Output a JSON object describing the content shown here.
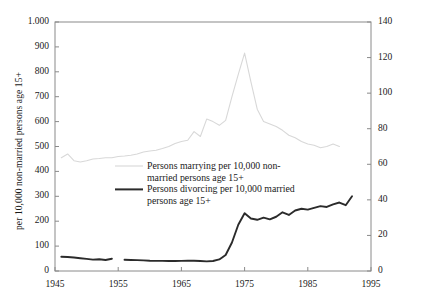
{
  "chart_data": {
    "type": "line",
    "title": "",
    "subtitle": "",
    "xlabel": "",
    "ylabel": "per 10,000 non-married persons age 15+",
    "y2label": "per 10,000 married persons",
    "xlim": [
      1945,
      1995
    ],
    "ylim": [
      0,
      1000
    ],
    "y2lim": [
      0,
      140
    ],
    "grid": false,
    "legend_position": "inside-center-left",
    "xticks": [
      "1945",
      "1955",
      "1965",
      "1975",
      "1985",
      "1995"
    ],
    "xtick_values": [
      1945,
      1955,
      1965,
      1975,
      1985,
      1995
    ],
    "yticks": [
      "0",
      "100",
      "200",
      "300",
      "400",
      "500",
      "600",
      "700",
      "800",
      "900",
      "1.000"
    ],
    "ytick_values": [
      0,
      100,
      200,
      300,
      400,
      500,
      600,
      700,
      800,
      900,
      1000
    ],
    "y2ticks": [
      "0",
      "20",
      "40",
      "60",
      "80",
      "100",
      "120",
      "140"
    ],
    "y2tick_values": [
      0,
      20,
      40,
      60,
      80,
      100,
      120,
      140
    ],
    "series": [
      {
        "name": "Persons marrying per 10,000 non-married persons age 15+",
        "axis": "left",
        "color": "#d8d8d8",
        "width": 1.1,
        "x": [
          1946,
          1947,
          1948,
          1949,
          1950,
          1951,
          1952,
          1953,
          1954,
          1955,
          1956,
          1957,
          1958,
          1959,
          1960,
          1961,
          1962,
          1963,
          1964,
          1965,
          1966,
          1967,
          1968,
          1969,
          1970,
          1971,
          1972,
          1973,
          1974,
          1975,
          1976,
          1977,
          1978,
          1979,
          1980,
          1981,
          1982,
          1983,
          1984,
          1985,
          1986,
          1987,
          1988,
          1989,
          1990
        ],
        "values": [
          455,
          470,
          443,
          438,
          443,
          450,
          452,
          455,
          455,
          460,
          462,
          465,
          470,
          478,
          482,
          485,
          492,
          500,
          512,
          520,
          525,
          560,
          540,
          610,
          600,
          585,
          605,
          700,
          790,
          875,
          760,
          650,
          600,
          590,
          580,
          565,
          545,
          535,
          520,
          510,
          505,
          495,
          500,
          510,
          500
        ]
      },
      {
        "name": "Persons divorcing per 10,000 married persons age 15+",
        "axis": "right",
        "color": "#2b2b2b",
        "width": 1.9,
        "segments": [
          {
            "x": [
              1946,
              1947,
              1948,
              1949,
              1950,
              1951,
              1952,
              1953,
              1954
            ],
            "values": [
              8.0,
              7.9,
              7.6,
              7.2,
              6.8,
              6.4,
              6.6,
              6.2,
              6.9
            ]
          },
          {
            "x": [
              1956,
              1957,
              1958,
              1959,
              1960,
              1961,
              1962,
              1963,
              1964,
              1965,
              1966,
              1967,
              1968,
              1969,
              1970,
              1971,
              1972,
              1973,
              1974,
              1975,
              1976,
              1977,
              1978,
              1979,
              1980,
              1981,
              1982,
              1983,
              1984,
              1985,
              1986,
              1987,
              1988,
              1989,
              1990,
              1991,
              1992
            ],
            "values": [
              6.3,
              6.2,
              6.1,
              6.0,
              5.8,
              5.7,
              5.7,
              5.6,
              5.6,
              5.7,
              5.8,
              5.8,
              5.6,
              5.4,
              5.6,
              6.5,
              9.0,
              16.0,
              26.0,
              32.5,
              29.5,
              28.8,
              30.0,
              29.0,
              30.5,
              33.0,
              31.5,
              34.0,
              35.0,
              34.5,
              35.5,
              36.5,
              36.0,
              37.5,
              38.5,
              37.0,
              42.0
            ]
          }
        ]
      }
    ],
    "legend": [
      {
        "label": "Persons marrying per 10,000 non-\nmarried persons age 15+",
        "color": "#d8d8d8",
        "width": 1.1
      },
      {
        "label": "Persons divorcing per 10,000 married\npersons age 15+",
        "color": "#2b2b2b",
        "width": 2.0
      }
    ]
  }
}
